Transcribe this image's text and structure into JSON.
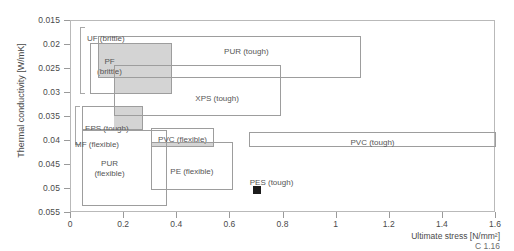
{
  "chart_data": {
    "type": "bar",
    "title": "",
    "xlabel": "Ultimate stress [N/mm²]",
    "ylabel": "Thermal conductivity [W/mK]",
    "xlim": [
      0,
      1.6
    ],
    "ylim": [
      0.015,
      0.055
    ],
    "y_inverted": true,
    "grid": false,
    "legend": "none",
    "xticks": [
      "0",
      "0.2",
      "0.4",
      "0.6",
      "0.8",
      "1",
      "1.2",
      "1.4",
      "1.6"
    ],
    "xtick_values": [
      0,
      0.2,
      0.4,
      0.6,
      0.8,
      1.0,
      1.2,
      1.4,
      1.6
    ],
    "yticks": [
      "0.015",
      "0.02",
      "0.025",
      "0.03",
      "0.035",
      "0.04",
      "0.045",
      "0.05",
      "0.055"
    ],
    "ytick_values": [
      0.015,
      0.02,
      0.025,
      0.03,
      0.035,
      0.04,
      0.045,
      0.05,
      0.055
    ],
    "boxes": [
      {
        "name": "PF (brittle)",
        "label": "PF\n(brittle)",
        "x0": 0.07,
        "x1": 0.38,
        "y0": 0.0195,
        "y1": 0.0302,
        "shaded": false,
        "label_x": 0.145,
        "label_y": 0.0225
      },
      {
        "name": "PUR (tough)",
        "label": "PUR (tough)",
        "x0": 0.1,
        "x1": 1.09,
        "y0": 0.0182,
        "y1": 0.0268,
        "shaded": false,
        "label_x": 0.66,
        "label_y": 0.0205
      },
      {
        "name": "XPS (tough)",
        "label": "XPS (tough)",
        "x0": 0.16,
        "x1": 0.79,
        "y0": 0.0242,
        "y1": 0.0347,
        "shaded": false,
        "label_x": 0.55,
        "label_y": 0.0302
      },
      {
        "name": "EPS (tough)",
        "label": "EPS (tough)",
        "x0": 0.04,
        "x1": 0.27,
        "y0": 0.0328,
        "y1": 0.0378,
        "shaded": false,
        "label_x": 0.135,
        "label_y": 0.0365
      },
      {
        "name": "PUR (flexible)",
        "label": "PUR\n(flexible)",
        "x0": 0.04,
        "x1": 0.36,
        "y0": 0.0378,
        "y1": 0.0535,
        "shaded": false,
        "label_x": 0.145,
        "label_y": 0.0438
      },
      {
        "name": "PVC (flexible)",
        "label": "PVC (flexible)",
        "x0": 0.3,
        "x1": 0.54,
        "y0": 0.0372,
        "y1": 0.0413,
        "shaded": false,
        "label_x": 0.42,
        "label_y": 0.0388
      },
      {
        "name": "PE (flexible)",
        "label": "PE (flexible)",
        "x0": 0.3,
        "x1": 0.61,
        "y0": 0.0403,
        "y1": 0.0503,
        "shaded": false,
        "label_x": 0.455,
        "label_y": 0.0455
      },
      {
        "name": "PVC (tough)",
        "label": "PVC (tough)",
        "x0": 0.67,
        "x1": 1.6,
        "y0": 0.0382,
        "y1": 0.0412,
        "shaded": false,
        "label_x": 1.135,
        "label_y": 0.0393
      }
    ],
    "shaded_overlaps": [
      {
        "name": "overlap-pf-pur",
        "x0": 0.1,
        "x1": 0.38,
        "y0": 0.0195,
        "y1": 0.0268
      },
      {
        "name": "overlap-pf-xps",
        "x0": 0.16,
        "x1": 0.38,
        "y0": 0.0242,
        "y1": 0.0302
      },
      {
        "name": "overlap-eps-xps",
        "x0": 0.16,
        "x1": 0.27,
        "y0": 0.0328,
        "y1": 0.0378
      },
      {
        "name": "overlap-pvc-pe",
        "x0": 0.3,
        "x1": 0.54,
        "y0": 0.0403,
        "y1": 0.0413
      }
    ],
    "points": [
      {
        "name": "PES (tough)",
        "label": "PES (tough)",
        "x": 0.7,
        "y": 0.0502,
        "marker": "filled-square",
        "color": "#1c1c1c",
        "label_x": 0.755,
        "label_y": 0.0478
      }
    ],
    "annotations": [
      {
        "name": "UF (brittle)",
        "label": "UF (brittle)",
        "bracket_y0": 0.0162,
        "bracket_y1": 0.0302,
        "bracket_x": 0.035,
        "label_x": 0.06,
        "label_y": 0.0178
      },
      {
        "name": "MF (flexible)",
        "label": "MF (flexible)",
        "bracket_y0": 0.0328,
        "bracket_y1": 0.0408,
        "bracket_x": 0.015,
        "label_x": 0.015,
        "label_y": 0.0398
      }
    ]
  },
  "figure": {
    "reference": "C 1.16"
  },
  "colors": {
    "axis": "#b9b9b9",
    "box_stroke": "#9d9d9d",
    "shaded_fill": "#d4d4d4",
    "text": "#4a4a4a",
    "marker": "#1c1c1c"
  }
}
